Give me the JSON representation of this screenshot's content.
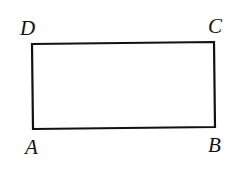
{
  "diagram": {
    "type": "rectangle",
    "stroke_color": "#111111",
    "background": "#ffffff",
    "vertices": [
      {
        "label": "A",
        "x": 33,
        "y": 129
      },
      {
        "label": "B",
        "x": 215,
        "y": 127
      },
      {
        "label": "C",
        "x": 214,
        "y": 42
      },
      {
        "label": "D",
        "x": 32,
        "y": 44
      }
    ],
    "labels": {
      "A": "A",
      "B": "B",
      "C": "C",
      "D": "D"
    }
  }
}
